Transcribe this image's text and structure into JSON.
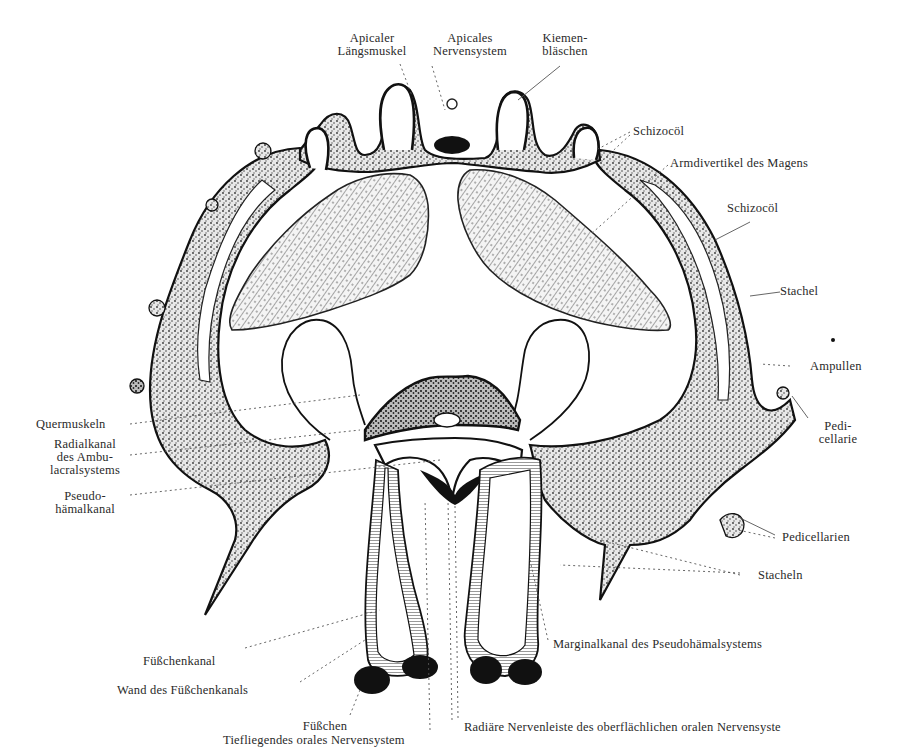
{
  "figure": {
    "background": "#ffffff",
    "ink_color": "#111111",
    "label_color": "#2a2a2a"
  },
  "labels": {
    "apicaler_laengsmuskel": [
      "Apicaler",
      "Längsmuskel"
    ],
    "apicales_nervensystem": [
      "Apicales",
      "Nervensystem"
    ],
    "kiemenblaeschen": [
      "Kiemen-",
      "bläschen"
    ],
    "schizocoel_top": "Schizocöl",
    "armdivertikel": "Armdivertikel des Magens",
    "schizocoel_right": "Schizocöl",
    "stachel": "Stachel",
    "ampullen": "Ampullen",
    "pedicellarie": [
      "Pedi-",
      "cellarie"
    ],
    "quermuskeln": "Quermuskeln",
    "radialkanal": [
      "Radialkanal",
      "des Ambu-",
      "lacralsystems"
    ],
    "pseudohaemalkanal": [
      "Pseudo-",
      "hämalkanal"
    ],
    "pedicellarien": "Pedicellarien",
    "stacheln": "Stacheln",
    "marginalkanal": "Marginalkanal des Pseudohämalsystems",
    "fuesschenkanal": "Füßchenkanal",
    "wand_fuesschenkanal": "Wand des Füßchenkanals",
    "fuesschen": "Füßchen",
    "tiefliegendes": "Tiefliegendes orales Nervensystem",
    "radiaere_nervenleiste": "Radiäre Nervenleiste des oberflächlichen oralen Nervensyste"
  }
}
